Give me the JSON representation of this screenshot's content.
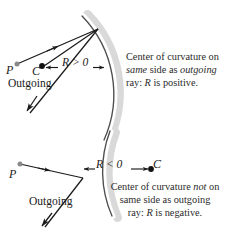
{
  "figure": {
    "background_color": "#ffffff",
    "line_color": "#1a1a1a",
    "band_color": "#d8d8d8",
    "text_color": "#2b2b2b"
  },
  "top_panel": {
    "point_p": "P",
    "point_c": "C",
    "r_label": "R > 0",
    "outgoing_label": "Outgoing",
    "caption_line1_a": "Center of curvature on",
    "caption_line2_a": "same",
    "caption_line2_b": " side as ",
    "caption_line2_c": "outgoing",
    "caption_line3_a": "ray: ",
    "caption_line3_r": "R",
    "caption_line3_b": " is positive.",
    "caption_plain": "Center of curvature on same side as outgoing ray: R is positive."
  },
  "bottom_panel": {
    "point_p": "P",
    "point_c": "C",
    "r_label": "R < 0",
    "outgoing_label": "Outgoing",
    "caption_line1_a": "Center of curvature ",
    "caption_line1_not": "not",
    "caption_line1_b": " on",
    "caption_line2": "same side as outgoing",
    "caption_line3_a": "ray: ",
    "caption_line3_r": "R",
    "caption_line3_b": " is negative.",
    "caption_plain": "Center of curvature not on same side as outgoing ray: R is negative."
  },
  "icons": {
    "arrowhead": "arrowhead-icon",
    "dot_filled": "filled-dot-icon",
    "dot_gray": "gray-dot-icon",
    "arc_top": "concave-surface-arc",
    "arc_bottom": "convex-surface-arc"
  }
}
